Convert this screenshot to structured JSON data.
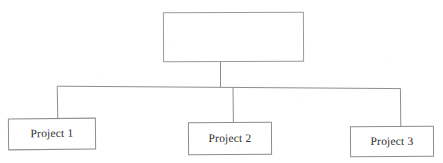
{
  "diagram": {
    "type": "org-tree",
    "orientation": "top-down",
    "background_color": "#ffffff",
    "line_color": "#8e8e8e",
    "text_color": "#2e2e2e",
    "root": {
      "id": "root",
      "label": "",
      "note": "empty parent box (no visible text)"
    },
    "children": [
      {
        "id": "project-1",
        "label": "Project 1"
      },
      {
        "id": "project-2",
        "label": "Project 2"
      },
      {
        "id": "project-3",
        "label": "Project 3"
      }
    ],
    "connectors": {
      "root_stem_x": 220,
      "bus_y": 87,
      "bus_x_start": 57,
      "bus_x_end": 400,
      "drops_x": [
        57,
        233,
        400
      ]
    }
  }
}
